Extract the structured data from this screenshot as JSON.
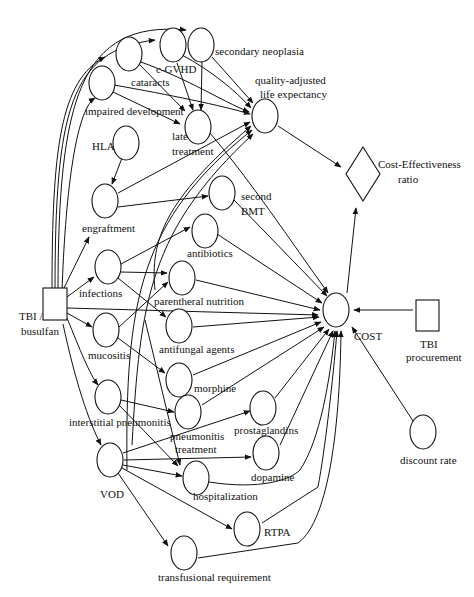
{
  "diagram": {
    "type": "influence-diagram",
    "decision_nodes": [
      {
        "id": "tbi_busulfan",
        "label_line1": "TBI /",
        "label_line2": "busulfan"
      },
      {
        "id": "tbi_procurement",
        "label_line1": "TBI",
        "label_line2": "procurement"
      }
    ],
    "value_node": {
      "id": "ce_ratio",
      "label_line1": "Cost-Effectiveness",
      "label_line2": "ratio"
    },
    "chance_nodes": {
      "cataracts": "cataracts",
      "c_gvhd": "c-GVHD",
      "secondary_neoplasia": "secondary neoplasia",
      "impaired_development": "impaired development",
      "late_treatment_1": "late",
      "late_treatment_2": "treatment",
      "quality_1": "quality-adjusted",
      "quality_2": "life expectancy",
      "hla": "HLA",
      "engraftment": "engraftment",
      "second_bmt_1": "second",
      "second_bmt_2": "BMT",
      "antibiotics": "antibiotics",
      "infections": "infections",
      "parenteral_nutrition": "parentheral nutrition",
      "antifungal_agents": "antifungal agents",
      "mucositis": "mucositis",
      "morphine": "morphine",
      "interstitial_pneumonitis": "interstitial pneumonitis",
      "pneumonitis_treatment_1": "pneumonitis",
      "pneumonitis_treatment_2": "treatment",
      "prostaglandins": "prostaglandins",
      "dopamine": "dopamine",
      "vod": "VOD",
      "hospitalization": "hospitalization",
      "rtpa": "RTPA",
      "transfusional_requirement": "transfusional requirement",
      "cost": "COST",
      "discount_rate": "discount rate"
    },
    "edges": [
      [
        "TBI / busulfan",
        "cataracts"
      ],
      [
        "TBI / busulfan",
        "c-GVHD"
      ],
      [
        "TBI / busulfan",
        "secondary neoplasia"
      ],
      [
        "TBI / busulfan",
        "impaired development"
      ],
      [
        "TBI / busulfan",
        "engraftment"
      ],
      [
        "TBI / busulfan",
        "infections"
      ],
      [
        "TBI / busulfan",
        "mucositis"
      ],
      [
        "TBI / busulfan",
        "interstitial pneumonitis"
      ],
      [
        "TBI / busulfan",
        "VOD"
      ],
      [
        "TBI / busulfan",
        "COST"
      ],
      [
        "HLA",
        "engraftment"
      ],
      [
        "cataracts",
        "late treatment"
      ],
      [
        "cataracts",
        "quality-adjusted life expectancy"
      ],
      [
        "c-GVHD",
        "late treatment"
      ],
      [
        "c-GVHD",
        "quality-adjusted life expectancy"
      ],
      [
        "secondary neoplasia",
        "late treatment"
      ],
      [
        "secondary neoplasia",
        "quality-adjusted life expectancy"
      ],
      [
        "impaired development",
        "late treatment"
      ],
      [
        "impaired development",
        "quality-adjusted life expectancy"
      ],
      [
        "engraftment",
        "quality-adjusted life expectancy"
      ],
      [
        "engraftment",
        "second BMT"
      ],
      [
        "infections",
        "antibiotics"
      ],
      [
        "infections",
        "parentheral nutrition"
      ],
      [
        "infections",
        "antifungal agents"
      ],
      [
        "infections",
        "quality-adjusted life expectancy"
      ],
      [
        "mucositis",
        "parentheral nutrition"
      ],
      [
        "mucositis",
        "morphine"
      ],
      [
        "interstitial pneumonitis",
        "pneumonitis treatment"
      ],
      [
        "interstitial pneumonitis",
        "hospitalization"
      ],
      [
        "interstitial pneumonitis",
        "quality-adjusted life expectancy"
      ],
      [
        "VOD",
        "prostaglandins"
      ],
      [
        "VOD",
        "dopamine"
      ],
      [
        "VOD",
        "hospitalization"
      ],
      [
        "VOD",
        "RTPA"
      ],
      [
        "VOD",
        "transfusional requirement"
      ],
      [
        "VOD",
        "quality-adjusted life expectancy"
      ],
      [
        "late treatment",
        "COST"
      ],
      [
        "second BMT",
        "COST"
      ],
      [
        "antibiotics",
        "COST"
      ],
      [
        "parentheral nutrition",
        "COST"
      ],
      [
        "antifungal agents",
        "COST"
      ],
      [
        "morphine",
        "COST"
      ],
      [
        "pneumonitis treatment",
        "COST"
      ],
      [
        "prostaglandins",
        "COST"
      ],
      [
        "dopamine",
        "COST"
      ],
      [
        "hospitalization",
        "COST"
      ],
      [
        "RTPA",
        "COST"
      ],
      [
        "transfusional requirement",
        "COST"
      ],
      [
        "TBI procurement",
        "COST"
      ],
      [
        "discount rate",
        "COST"
      ],
      [
        "quality-adjusted life expectancy",
        "Cost-Effectiveness ratio"
      ],
      [
        "COST",
        "Cost-Effectiveness ratio"
      ]
    ]
  }
}
